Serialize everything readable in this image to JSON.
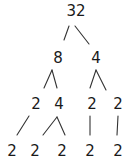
{
  "diagram": {
    "type": "factor-tree",
    "root": "32",
    "nodes": [
      {
        "id": "n32",
        "label": "32",
        "x": 76,
        "y": 4
      },
      {
        "id": "n8",
        "label": "8",
        "x": 58,
        "y": 51
      },
      {
        "id": "n4a",
        "label": "4",
        "x": 96,
        "y": 51
      },
      {
        "id": "n2a",
        "label": "2",
        "x": 36,
        "y": 97
      },
      {
        "id": "n4b",
        "label": "4",
        "x": 59,
        "y": 97
      },
      {
        "id": "n2b",
        "label": "2",
        "x": 92,
        "y": 97
      },
      {
        "id": "n2c",
        "label": "2",
        "x": 118,
        "y": 97
      },
      {
        "id": "l1",
        "label": "2",
        "x": 12,
        "y": 144
      },
      {
        "id": "l2",
        "label": "2",
        "x": 35,
        "y": 144
      },
      {
        "id": "l3",
        "label": "2",
        "x": 62,
        "y": 144
      },
      {
        "id": "l4",
        "label": "2",
        "x": 90,
        "y": 144
      },
      {
        "id": "l5",
        "label": "2",
        "x": 118,
        "y": 144
      }
    ],
    "edges": [
      {
        "from": "n32",
        "to": "n8",
        "x1": 69,
        "y1": 26,
        "x2": 64,
        "y2": 40
      },
      {
        "from": "n32",
        "to": "n4a",
        "x1": 75,
        "y1": 26,
        "x2": 89,
        "y2": 44
      },
      {
        "from": "n8",
        "to": "n2a",
        "x1": 52,
        "y1": 70,
        "x2": 44,
        "y2": 88
      },
      {
        "from": "n8",
        "to": "n4b",
        "x1": 52,
        "y1": 70,
        "x2": 57,
        "y2": 88
      },
      {
        "from": "n4a",
        "to": "n2b",
        "x1": 96,
        "y1": 70,
        "x2": 90,
        "y2": 88
      },
      {
        "from": "n4a",
        "to": "n2c",
        "x1": 96,
        "y1": 70,
        "x2": 106,
        "y2": 90
      },
      {
        "from": "n2a",
        "to": "l1",
        "x1": 29,
        "y1": 116,
        "x2": 17,
        "y2": 135
      },
      {
        "from": "n4b",
        "to": "l2",
        "x1": 57,
        "y1": 117,
        "x2": 43,
        "y2": 135
      },
      {
        "from": "n4b",
        "to": "l3",
        "x1": 57,
        "y1": 117,
        "x2": 65,
        "y2": 135
      },
      {
        "from": "n2b",
        "to": "l4",
        "x1": 90,
        "y1": 116,
        "x2": 90,
        "y2": 135
      },
      {
        "from": "n2c",
        "to": "l5",
        "x1": 118,
        "y1": 116,
        "x2": 117,
        "y2": 135
      }
    ]
  }
}
